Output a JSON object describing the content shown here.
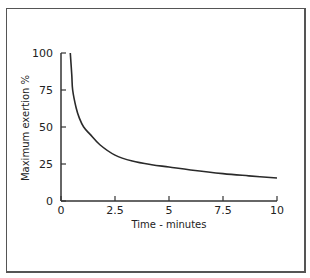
{
  "chart_data": {
    "type": "line",
    "title": "",
    "xlabel": "Time - minutes",
    "ylabel": "Maximum exertion %",
    "xlim": [
      0,
      10
    ],
    "ylim": [
      0,
      100
    ],
    "x_ticks": [
      "0",
      "2.5",
      "5",
      "7.5",
      "10"
    ],
    "y_ticks": [
      "0",
      "25",
      "50",
      "75",
      "100"
    ],
    "grid": false,
    "legend": null,
    "series": [
      {
        "name": "Maximum exertion",
        "x": [
          0.43,
          0.5,
          0.54,
          0.7,
          0.85,
          1.05,
          1.35,
          1.8,
          2.5,
          3.3,
          4.2,
          5,
          6,
          7.5,
          8.7,
          10
        ],
        "y": [
          100,
          85,
          75,
          63,
          56,
          50,
          45,
          38,
          31,
          27,
          24.5,
          23,
          21,
          18.5,
          17,
          15.5
        ]
      }
    ]
  }
}
